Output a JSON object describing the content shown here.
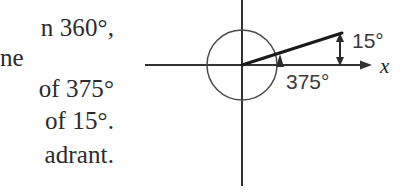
{
  "page": {
    "width": 408,
    "height": 193,
    "background": "#ffffff",
    "ink": "#2b2b2b"
  },
  "prose": {
    "lines": [
      {
        "text": "n 360°,",
        "x": 114,
        "y": 33,
        "align": "right"
      },
      {
        "text": "ne",
        "x": 0,
        "y": 63,
        "align": "left"
      },
      {
        "text": "of 375°",
        "x": 113,
        "y": 94,
        "align": "right"
      },
      {
        "text": "of 15°.",
        "x": 113,
        "y": 126,
        "align": "right"
      },
      {
        "text": "adrant.",
        "x": 110,
        "y": 160,
        "align": "right"
      }
    ]
  },
  "diagram": {
    "origin": {
      "x": 242,
      "y": 65
    },
    "x_axis": {
      "start_x": 145,
      "end_x": 372,
      "y": 65,
      "arrow": "right",
      "label": "x",
      "label_x": 380,
      "label_y": 72
    },
    "y_axis": {
      "x": 242,
      "start_y": 0,
      "end_y": 186
    },
    "unit_circle": {
      "center_x": 242,
      "center_y": 65,
      "radius": 35
    },
    "terminal_ray": {
      "from_x": 242,
      "from_y": 65,
      "to_x": 342,
      "to_y": 33,
      "angle_degrees": 15
    },
    "rotation_marker": {
      "x": 280,
      "y": 62,
      "direction": "up",
      "description": "arrowhead on positive x-axis showing direction of rotation"
    },
    "measure_arrow": {
      "x": 340,
      "top_y": 35,
      "bottom_y": 64,
      "heads": "both"
    },
    "labels": {
      "angle_15": {
        "text": "15°",
        "x": 352,
        "y": 48
      },
      "angle_375": {
        "text": "375°",
        "x": 286,
        "y": 89
      }
    },
    "colors": {
      "axis": "#333333",
      "circle": "#4a4a4a",
      "ray": "#1a1a1a",
      "label": "#3a3a3a"
    }
  }
}
